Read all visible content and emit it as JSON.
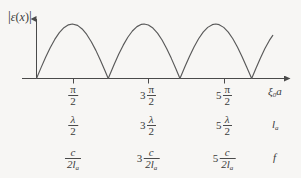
{
  "figure": {
    "background_color": "#f7f6f4",
    "ink_color": "#4a4a4a",
    "y_axis_label": "|ε(x)|",
    "x_axis_label": "ξ₀a",
    "x_axis_label_base": "ξ",
    "x_axis_label_sub": "0",
    "x_axis_label_tail": "a"
  },
  "rows": [
    {
      "name": "xi0a",
      "end_label": "ξ₀a",
      "ticks": [
        {
          "coef": "",
          "num": "π",
          "den": "2"
        },
        {
          "coef": "3",
          "num": "π",
          "den": "2"
        },
        {
          "coef": "5",
          "num": "π",
          "den": "2"
        }
      ]
    },
    {
      "name": "la",
      "end_label": "lₐ",
      "end_label_base": "l",
      "end_label_sub": "a",
      "ticks": [
        {
          "coef": "",
          "num": "λ",
          "den": "2"
        },
        {
          "coef": "3",
          "num": "λ",
          "den": "2"
        },
        {
          "coef": "5",
          "num": "λ",
          "den": "2"
        }
      ]
    },
    {
      "name": "f",
      "end_label": "f",
      "ticks": [
        {
          "coef": "",
          "num": "c",
          "den": "2lₐ",
          "den_base": "2l",
          "den_sub": "a"
        },
        {
          "coef": "3",
          "num": "c",
          "den": "2lₐ",
          "den_base": "2l",
          "den_sub": "a"
        },
        {
          "coef": "5",
          "num": "c",
          "den": "2lₐ",
          "den_base": "2l",
          "den_sub": "a"
        }
      ]
    }
  ],
  "chart_data": {
    "type": "line",
    "title": "",
    "xlabel": "ξ₀a",
    "ylabel": "|ε(x)|",
    "function": "|sin(ξ₀a)|",
    "xlim": [
      0,
      10.6
    ],
    "ylim": [
      0,
      1.12
    ],
    "grid": false,
    "legend": null,
    "xtick_values": [
      1.5708,
      4.7124,
      7.854
    ],
    "xtick_labels": [
      "π/2",
      "3π/2",
      "5π/2"
    ],
    "zero_crossings": [
      0,
      3.1416,
      6.2832,
      9.4248
    ],
    "peaks": [
      {
        "x": 1.5708,
        "y": 1.0
      },
      {
        "x": 4.7124,
        "y": 1.0
      },
      {
        "x": 7.854,
        "y": 1.0
      }
    ],
    "x": [
      0,
      0.2,
      0.4,
      0.6,
      0.8,
      1.0,
      1.2,
      1.4,
      1.5708,
      1.8,
      2.0,
      2.2,
      2.4,
      2.6,
      2.8,
      3.0,
      3.1416,
      3.4,
      3.6,
      3.8,
      4.0,
      4.2,
      4.4,
      4.6,
      4.7124,
      4.9,
      5.1,
      5.3,
      5.5,
      5.7,
      5.9,
      6.1,
      6.2832,
      6.5,
      6.7,
      6.9,
      7.1,
      7.3,
      7.5,
      7.7,
      7.854,
      8.0,
      8.2,
      8.4,
      8.6,
      8.8,
      9.0,
      9.2,
      9.4248,
      9.6,
      9.8,
      10.0,
      10.2,
      10.35
    ],
    "y": [
      0,
      0.199,
      0.389,
      0.565,
      0.717,
      0.841,
      0.932,
      0.985,
      1.0,
      0.974,
      0.909,
      0.808,
      0.675,
      0.516,
      0.335,
      0.141,
      0,
      0.256,
      0.443,
      0.612,
      0.757,
      0.872,
      0.952,
      0.994,
      1.0,
      0.982,
      0.926,
      0.832,
      0.706,
      0.551,
      0.374,
      0.182,
      0,
      0.215,
      0.405,
      0.579,
      0.729,
      0.85,
      0.938,
      0.988,
      1.0,
      0.988,
      0.938,
      0.85,
      0.729,
      0.579,
      0.405,
      0.215,
      0,
      0.176,
      0.368,
      0.544,
      0.699,
      0.79
    ]
  }
}
